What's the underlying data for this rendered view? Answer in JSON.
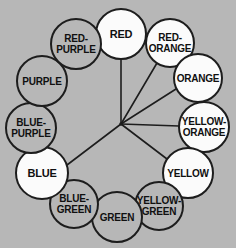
{
  "figure": {
    "type": "color-wheel-diagram",
    "width": 236,
    "height": 248,
    "background_color": "#b7b7b7",
    "line_color": "#1d1d1d",
    "filled_circle_color": "#fbfbfb",
    "hollow_circle_color": "#b7b7b7"
  },
  "chart_data": {
    "type": "diagram",
    "center": {
      "x": 121,
      "y": 124
    },
    "ring_radius": 90,
    "nodes": [
      {
        "id": "red",
        "label": "RED",
        "lines": [
          "RED"
        ],
        "clock": 12,
        "angle_deg": 0,
        "x": 121,
        "y": 34,
        "r": 25,
        "filled": true,
        "connected": true,
        "font_size": 11
      },
      {
        "id": "red-orange",
        "label": "RED-ORANGE",
        "lines": [
          "RED-",
          "ORANGE"
        ],
        "clock": 1,
        "angle_deg": 30,
        "x": 170,
        "y": 43,
        "r": 24,
        "filled": true,
        "connected": true,
        "font_size": 10
      },
      {
        "id": "orange",
        "label": "ORANGE",
        "lines": [
          "ORANGE"
        ],
        "clock": 2,
        "angle_deg": 60,
        "x": 198,
        "y": 78,
        "r": 24,
        "filled": true,
        "connected": true,
        "font_size": 10
      },
      {
        "id": "yellow-orange",
        "label": "YELLOW-ORANGE",
        "lines": [
          "YELLOW-",
          "ORANGE"
        ],
        "clock": 3,
        "angle_deg": 90,
        "x": 204,
        "y": 127,
        "r": 25,
        "filled": true,
        "connected": true,
        "font_size": 10
      },
      {
        "id": "yellow",
        "label": "YELLOW",
        "lines": [
          "YELLOW"
        ],
        "clock": 4,
        "angle_deg": 120,
        "x": 188,
        "y": 173,
        "r": 25,
        "filled": true,
        "connected": true,
        "font_size": 10
      },
      {
        "id": "yellow-green",
        "label": "YELLOW-GREEN",
        "lines": [
          "YELLOW-",
          "GREEN"
        ],
        "clock": 5,
        "angle_deg": 150,
        "x": 159,
        "y": 206,
        "r": 24,
        "filled": false,
        "connected": false,
        "font_size": 10
      },
      {
        "id": "green",
        "label": "GREEN",
        "lines": [
          "GREEN"
        ],
        "clock": 6,
        "angle_deg": 180,
        "x": 117,
        "y": 217,
        "r": 25,
        "filled": false,
        "connected": false,
        "font_size": 10
      },
      {
        "id": "blue-green",
        "label": "BLUE-GREEN",
        "lines": [
          "BLUE-",
          "GREEN"
        ],
        "clock": 7,
        "angle_deg": 210,
        "x": 74,
        "y": 204,
        "r": 24,
        "filled": false,
        "connected": false,
        "font_size": 10
      },
      {
        "id": "blue",
        "label": "BLUE",
        "lines": [
          "BLUE"
        ],
        "clock": 8,
        "angle_deg": 240,
        "x": 42,
        "y": 173,
        "r": 26,
        "filled": true,
        "connected": true,
        "font_size": 11
      },
      {
        "id": "blue-purple",
        "label": "BLUE-PURPLE",
        "lines": [
          "BLUE-",
          "PURPLE"
        ],
        "clock": 9,
        "angle_deg": 270,
        "x": 31,
        "y": 128,
        "r": 25,
        "filled": false,
        "connected": false,
        "font_size": 10
      },
      {
        "id": "purple",
        "label": "PURPLE",
        "lines": [
          "PURPLE"
        ],
        "clock": 10,
        "angle_deg": 300,
        "x": 42,
        "y": 81,
        "r": 25,
        "filled": false,
        "connected": false,
        "font_size": 10
      },
      {
        "id": "red-purple",
        "label": "RED-PURPLE",
        "lines": [
          "RED-",
          "PURPLE"
        ],
        "clock": 11,
        "angle_deg": 330,
        "x": 76,
        "y": 44,
        "r": 25,
        "filled": false,
        "connected": false,
        "font_size": 10
      }
    ],
    "spokes": [
      {
        "id": "spoke-red",
        "to": "red",
        "x2": 121,
        "y2": 59
      },
      {
        "id": "spoke-red-orange",
        "to": "red-orange",
        "x2": 157,
        "y2": 63
      },
      {
        "id": "spoke-orange",
        "to": "orange",
        "x2": 176,
        "y2": 89
      },
      {
        "id": "spoke-yellow-orange",
        "to": "yellow-orange",
        "x2": 179,
        "y2": 126
      },
      {
        "id": "spoke-yellow",
        "to": "yellow",
        "x2": 167,
        "y2": 159
      },
      {
        "id": "spoke-blue",
        "to": "blue",
        "x2": 67,
        "y2": 165
      }
    ]
  }
}
